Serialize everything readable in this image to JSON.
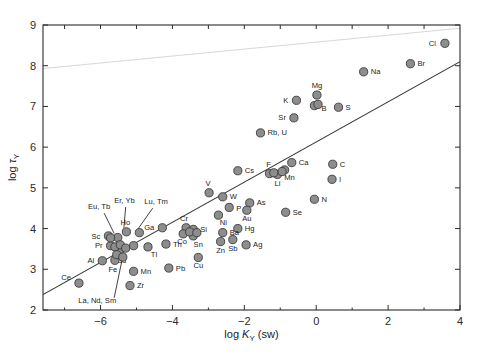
{
  "chart_data": {
    "type": "scatter",
    "title": "",
    "xlabel": "log K_Y (sw)",
    "xlabel_parts": {
      "pre": "log ",
      "sym": "K",
      "sub": "Y",
      "post": " (sw)"
    },
    "ylabel": "log τ_Y",
    "ylabel_parts": {
      "pre": "log ",
      "sym": "τ",
      "sub": "Y"
    },
    "xlim": [
      -7.6,
      4.0
    ],
    "ylim": [
      2.0,
      9.0
    ],
    "xticks": [
      -6,
      -4,
      -2,
      0,
      2,
      4
    ],
    "xtick_labels": [
      "−6",
      "−4",
      "−2",
      "0",
      "2",
      "4"
    ],
    "yticks": [
      2,
      3,
      4,
      5,
      6,
      7,
      8,
      9
    ],
    "ytick_labels": [
      "2",
      "3",
      "4",
      "5",
      "6",
      "7",
      "8",
      "9"
    ],
    "xminor": [
      -7,
      -5,
      -3,
      -1,
      1,
      3
    ],
    "grid": false,
    "legend": false,
    "marker": {
      "fill": "#8d8d8d",
      "stroke": "#3a3a3a",
      "radius": 4.1
    },
    "trendline": {
      "x0": -7.6,
      "y0": 2.38,
      "x1": 4.0,
      "y1": 8.1,
      "color": "#3a3a3a"
    },
    "faint_line": {
      "x0": -7.6,
      "y0": 7.93,
      "x1": 4.0,
      "y1": 8.92,
      "color": "#ded6d4"
    },
    "points": [
      {
        "label": "Cl",
        "x": 3.58,
        "y": 8.55,
        "lx": -9,
        "ly": 2.6,
        "anchor": "end"
      },
      {
        "label": "Br",
        "x": 2.62,
        "y": 8.05,
        "lx": 7,
        "ly": 2.6,
        "anchor": "start"
      },
      {
        "label": "Na",
        "x": 1.32,
        "y": 7.85,
        "lx": 7,
        "ly": 2.6,
        "anchor": "start"
      },
      {
        "label": "S",
        "x": 0.62,
        "y": 6.98,
        "lx": 7,
        "ly": 2.6,
        "anchor": "start"
      },
      {
        "label": "Mg",
        "x": 0.02,
        "y": 7.28,
        "lx": 0,
        "ly": -7,
        "anchor": "middle"
      },
      {
        "label": "B",
        "x": -0.05,
        "y": 7.02,
        "lx": 7,
        "ly": 5.5,
        "anchor": "start"
      },
      {
        "label": "K",
        "x": -0.55,
        "y": 7.15,
        "lx": -8,
        "ly": 2.6,
        "anchor": "end"
      },
      {
        "label": "Sr",
        "x": -0.62,
        "y": 6.72,
        "lx": -8,
        "ly": 2.6,
        "anchor": "end"
      },
      {
        "label": "Rb, U",
        "x": -1.55,
        "y": 6.35,
        "lx": 7,
        "ly": 2.6,
        "anchor": "start"
      },
      {
        "label": "Ca",
        "x": -0.68,
        "y": 5.62,
        "lx": 7,
        "ly": 2.6,
        "anchor": "start"
      },
      {
        "label": "C",
        "x": 0.46,
        "y": 5.58,
        "lx": 7,
        "ly": 2.6,
        "anchor": "start"
      },
      {
        "label": "I",
        "x": 0.44,
        "y": 5.21,
        "lx": 7,
        "ly": 2.6,
        "anchor": "start"
      },
      {
        "label": "F",
        "x": -1.3,
        "y": 5.35,
        "lx": -1,
        "ly": -7,
        "anchor": "middle"
      },
      {
        "label": "Li",
        "x": -1.08,
        "y": 5.33,
        "lx": 0,
        "ly": 11.5,
        "anchor": "middle"
      },
      {
        "label": "Mn",
        "x": -0.88,
        "y": 5.44,
        "lx": 5,
        "ly": 10,
        "anchor": "middle"
      },
      {
        "label": "Cs",
        "x": -2.18,
        "y": 5.42,
        "lx": 7,
        "ly": 2.6,
        "anchor": "start"
      },
      {
        "label": "V",
        "x": -2.98,
        "y": 4.88,
        "lx": -1,
        "ly": -7,
        "anchor": "middle"
      },
      {
        "label": "W",
        "x": -2.6,
        "y": 4.78,
        "lx": 7,
        "ly": 2.6,
        "anchor": "start"
      },
      {
        "label": "As",
        "x": -1.85,
        "y": 4.63,
        "lx": 7,
        "ly": 2.0,
        "anchor": "start"
      },
      {
        "label": "Au",
        "x": -1.93,
        "y": 4.45,
        "lx": 0,
        "ly": 11,
        "anchor": "middle"
      },
      {
        "label": "P",
        "x": -2.42,
        "y": 4.52,
        "lx": 7,
        "ly": 3.4,
        "anchor": "start"
      },
      {
        "label": "N",
        "x": -0.05,
        "y": 4.72,
        "lx": 7,
        "ly": 2.6,
        "anchor": "start"
      },
      {
        "label": "Se",
        "x": -0.85,
        "y": 4.4,
        "lx": 7,
        "ly": 2.6,
        "anchor": "start"
      },
      {
        "label": "Ni",
        "x": -2.72,
        "y": 4.33,
        "lx": 5,
        "ly": 10,
        "anchor": "middle"
      },
      {
        "label": "Cr",
        "x": -3.62,
        "y": 4.02,
        "lx": -2,
        "ly": -7,
        "anchor": "middle"
      },
      {
        "label": "Si",
        "x": -3.42,
        "y": 3.98,
        "lx": 7,
        "ly": 3.0,
        "anchor": "start"
      },
      {
        "label": "Co",
        "x": -3.7,
        "y": 3.87,
        "lx": -1,
        "ly": 10.5,
        "anchor": "middle"
      },
      {
        "label": "Sn",
        "x": -3.42,
        "y": 3.82,
        "lx": 5,
        "ly": 11,
        "anchor": "middle"
      },
      {
        "label": "Ga",
        "x": -4.28,
        "y": 4.02,
        "lx": -8,
        "ly": 2.6,
        "anchor": "end"
      },
      {
        "label": "Hg",
        "x": -2.18,
        "y": 4.0,
        "lx": 7,
        "ly": 2.6,
        "anchor": "start"
      },
      {
        "label": "Ba",
        "x": -2.6,
        "y": 3.9,
        "lx": 7,
        "ly": 2.6,
        "anchor": "start"
      },
      {
        "label": "Sb",
        "x": -2.32,
        "y": 3.73,
        "lx": 0,
        "ly": 11,
        "anchor": "middle"
      },
      {
        "label": "Zn",
        "x": -2.66,
        "y": 3.68,
        "lx": 0,
        "ly": 11,
        "anchor": "middle"
      },
      {
        "label": "Ag",
        "x": -1.95,
        "y": 3.6,
        "lx": 7,
        "ly": 2.6,
        "anchor": "start"
      },
      {
        "label": "Th",
        "x": -4.18,
        "y": 3.62,
        "lx": 7,
        "ly": 3.2,
        "anchor": "start"
      },
      {
        "label": "Tl",
        "x": -4.68,
        "y": 3.55,
        "lx": 6,
        "ly": 10,
        "anchor": "middle"
      },
      {
        "label": "Ho",
        "x": -5.28,
        "y": 3.92,
        "lx": -1,
        "ly": -7,
        "anchor": "middle"
      },
      {
        "label": "Sc",
        "x": -5.78,
        "y": 3.82,
        "lx": -8,
        "ly": 2.6,
        "anchor": "end"
      },
      {
        "label": "Pr",
        "x": -5.72,
        "y": 3.58,
        "lx": -8,
        "ly": 2.6,
        "anchor": "end"
      },
      {
        "label": "Gd",
        "x": -5.48,
        "y": 3.42,
        "lx": 2,
        "ly": 11,
        "anchor": "middle"
      },
      {
        "label": "Al",
        "x": -5.95,
        "y": 3.21,
        "lx": -8,
        "ly": 2.6,
        "anchor": "end"
      },
      {
        "label": "Fe",
        "x": -5.6,
        "y": 3.22,
        "lx": -2,
        "ly": 12,
        "anchor": "middle"
      },
      {
        "label": "Ce",
        "x": -6.6,
        "y": 2.66,
        "lx": -8,
        "ly": -3,
        "anchor": "end"
      },
      {
        "label": "Mn",
        "x": -5.08,
        "y": 2.95,
        "lx": 7,
        "ly": 2.6,
        "anchor": "start"
      },
      {
        "label": "Zr",
        "x": -5.18,
        "y": 2.6,
        "lx": 7,
        "ly": 2.6,
        "anchor": "start"
      },
      {
        "label": "Pb",
        "x": -4.1,
        "y": 3.03,
        "lx": 7,
        "ly": 2.6,
        "anchor": "start"
      },
      {
        "label": "Cu",
        "x": -3.28,
        "y": 3.29,
        "lx": 0,
        "ly": 11,
        "anchor": "middle"
      },
      {
        "label": "",
        "x": -5.52,
        "y": 3.78,
        "lx": 0,
        "ly": 0,
        "anchor": "middle"
      },
      {
        "label": "",
        "x": -5.72,
        "y": 3.77,
        "lx": 0,
        "ly": 0,
        "anchor": "middle"
      },
      {
        "label": "",
        "x": -4.92,
        "y": 3.9,
        "lx": 0,
        "ly": 0,
        "anchor": "middle"
      },
      {
        "label": "",
        "x": -5.6,
        "y": 3.55,
        "lx": 0,
        "ly": 0,
        "anchor": "middle"
      },
      {
        "label": "",
        "x": -5.45,
        "y": 3.6,
        "lx": 0,
        "ly": 0,
        "anchor": "middle"
      },
      {
        "label": "",
        "x": -5.3,
        "y": 3.52,
        "lx": 0,
        "ly": 0,
        "anchor": "middle"
      },
      {
        "label": "",
        "x": -5.55,
        "y": 3.36,
        "lx": 0,
        "ly": 0,
        "anchor": "middle"
      },
      {
        "label": "",
        "x": -5.38,
        "y": 3.3,
        "lx": 0,
        "ly": 0,
        "anchor": "middle"
      },
      {
        "label": "",
        "x": -5.08,
        "y": 3.58,
        "lx": 0,
        "ly": 0,
        "anchor": "middle"
      },
      {
        "label": "",
        "x": -3.52,
        "y": 3.92,
        "lx": 0,
        "ly": 0,
        "anchor": "middle"
      },
      {
        "label": "",
        "x": -3.32,
        "y": 3.9,
        "lx": 0,
        "ly": 0,
        "anchor": "middle"
      },
      {
        "label": "",
        "x": -0.95,
        "y": 5.4,
        "lx": 0,
        "ly": 0,
        "anchor": "middle"
      },
      {
        "label": "",
        "x": -1.18,
        "y": 5.37,
        "lx": 0,
        "ly": 0,
        "anchor": "middle"
      },
      {
        "label": "",
        "x": 0.05,
        "y": 7.05,
        "lx": 0,
        "ly": 0,
        "anchor": "middle"
      }
    ],
    "leader_labels": [
      {
        "text": "Eu, Tb",
        "tx": -6.35,
        "ty": 4.47,
        "anchor": "start",
        "x0": -5.9,
        "y0": 4.38,
        "x1": -5.62,
        "y1": 3.88
      },
      {
        "text": "Er, Yb",
        "tx": -5.62,
        "ty": 4.62,
        "anchor": "start",
        "x0": -5.3,
        "y0": 4.53,
        "x1": -5.35,
        "y1": 4.02
      },
      {
        "text": "Lu, Tm",
        "tx": -4.78,
        "ty": 4.6,
        "anchor": "start",
        "x0": -4.55,
        "y0": 4.5,
        "x1": -4.95,
        "y1": 4.0
      },
      {
        "text": "La, Nd, Sm",
        "tx": -6.62,
        "ty": 2.17,
        "anchor": "start",
        "x0": -5.62,
        "y0": 2.3,
        "x1": -5.38,
        "y1": 3.32
      }
    ]
  }
}
